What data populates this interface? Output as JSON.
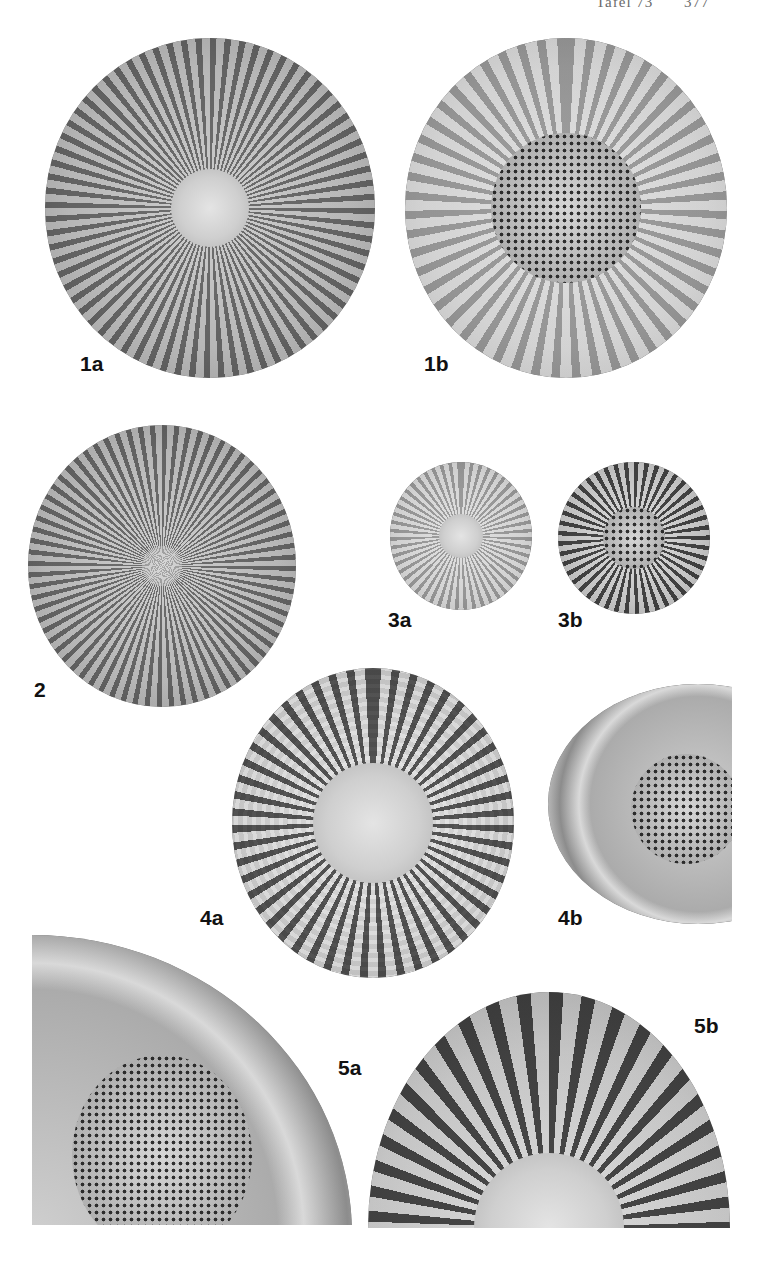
{
  "header": {
    "plate": "Tafel 73",
    "page_number": "377"
  },
  "figures": [
    {
      "id": "1a",
      "label": "1a",
      "description": "diatom valve, radial striae, hyaline central area"
    },
    {
      "id": "1b",
      "label": "1b",
      "description": "diatom valve, radial striae, areolate central area"
    },
    {
      "id": "2",
      "label": "2",
      "description": "diatom valve, fine radial striae"
    },
    {
      "id": "3a",
      "label": "3a",
      "description": "small diatom valve, radial striae"
    },
    {
      "id": "3b",
      "label": "3b",
      "description": "small diatom valve, coarse striae, areolate center"
    },
    {
      "id": "4a",
      "label": "4a",
      "description": "diatom valve, rows of areolae, plain central area"
    },
    {
      "id": "4b",
      "label": "4b",
      "description": "partial diatom valve, areolate central area (cropped)"
    },
    {
      "id": "5a",
      "label": "5a",
      "description": "enlarged quarter valve, areolate central area"
    },
    {
      "id": "5b",
      "label": "5b",
      "description": "enlarged half valve, radial striae"
    }
  ]
}
